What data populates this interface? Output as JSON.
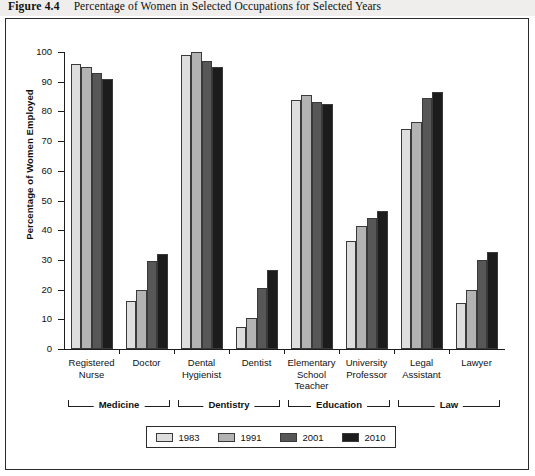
{
  "caption": {
    "figure_number": "Figure 4.4",
    "title": "Percentage of Women in Selected Occupations for Selected Years"
  },
  "chart_data": {
    "type": "bar",
    "title": "Percentage of Women in Selected Occupations for Selected Years",
    "xlabel": "",
    "ylabel": "Percentage of Women Employed",
    "ylim": [
      0,
      100
    ],
    "ytick_labels": [
      "0",
      "10",
      "20",
      "30",
      "40",
      "50",
      "60",
      "70",
      "80",
      "90",
      "100"
    ],
    "yticks": [
      0,
      10,
      20,
      30,
      40,
      50,
      60,
      70,
      80,
      90,
      100
    ],
    "grid": false,
    "legend_position": "bottom",
    "categories": [
      "Registered Nurse",
      "Doctor",
      "Dental Hygienist",
      "Dentist",
      "Elementary School Teacher",
      "University Professor",
      "Legal Assistant",
      "Lawyer"
    ],
    "category_lines": [
      [
        "Registered",
        "Nurse"
      ],
      [
        "Doctor"
      ],
      [
        "Dental",
        "Hygienist"
      ],
      [
        "Dentist"
      ],
      [
        "Elementary",
        "School",
        "Teacher"
      ],
      [
        "University",
        "Professor"
      ],
      [
        "Legal",
        "Assistant"
      ],
      [
        "Lawyer"
      ]
    ],
    "series": [
      {
        "name": "1983",
        "color": "#dedede",
        "values": [
          96,
          16,
          99,
          7.5,
          84,
          36.5,
          74,
          15.5
        ]
      },
      {
        "name": "1991",
        "color": "#b3b3b3",
        "values": [
          95,
          20,
          100,
          10.5,
          85.5,
          41.5,
          76.5,
          20
        ]
      },
      {
        "name": "2001",
        "color": "#575757",
        "values": [
          93,
          29.5,
          97,
          20.5,
          83,
          44,
          84.5,
          30
        ]
      },
      {
        "name": "2010",
        "color": "#1c1c1c",
        "values": [
          91,
          32,
          95,
          26.5,
          82.5,
          46.5,
          86.5,
          32.5
        ]
      }
    ],
    "field_groups": [
      {
        "label": "Medicine",
        "categories": [
          "Registered Nurse",
          "Doctor"
        ]
      },
      {
        "label": "Dentistry",
        "categories": [
          "Dental Hygienist",
          "Dentist"
        ]
      },
      {
        "label": "Education",
        "categories": [
          "Elementary School Teacher",
          "University Professor"
        ]
      },
      {
        "label": "Law",
        "categories": [
          "Legal Assistant",
          "Lawyer"
        ]
      }
    ]
  }
}
